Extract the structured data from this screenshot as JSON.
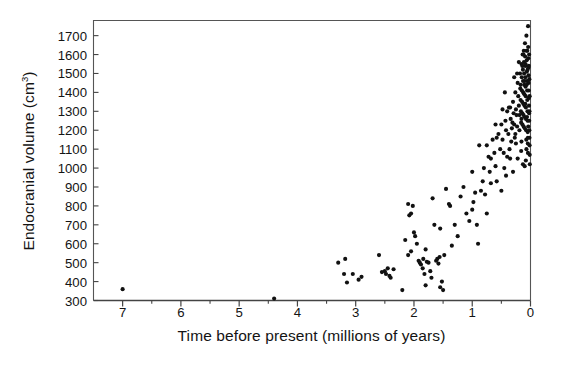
{
  "chart_data": {
    "type": "scatter",
    "title": "",
    "xlabel": "Time before present (millions of years)",
    "ylabel": "Endocranial volume (cm³)",
    "ylabel_text": "Endocranial volume (cm",
    "ylabel_sup": "3",
    "ylabel_tail": ")",
    "xlim": [
      7.5,
      0
    ],
    "ylim": [
      300,
      1780
    ],
    "x_reversed": true,
    "grid": false,
    "legend": null,
    "xticks": [
      7,
      6,
      5,
      4,
      3,
      2,
      1,
      0
    ],
    "xtick_labels": [
      "7",
      "6",
      "5",
      "4",
      "3",
      "2",
      "1",
      "0"
    ],
    "xminor_ticks": [
      6.5,
      5.5,
      4.5,
      3.5,
      2.5,
      1.5,
      0.5
    ],
    "yticks": [
      300,
      400,
      500,
      600,
      700,
      800,
      900,
      1000,
      1100,
      1200,
      1300,
      1400,
      1500,
      1600,
      1700
    ],
    "ytick_labels": [
      "300",
      "400",
      "500",
      "600",
      "700",
      "800",
      "900",
      "1000",
      "1100",
      "1200",
      "1300",
      "1400",
      "1500",
      "1600",
      "1700"
    ],
    "marker": "filled-circle",
    "marker_color": "#111111",
    "marker_size_px": 3.0,
    "points": [
      [
        7.0,
        360
      ],
      [
        4.4,
        310
      ],
      [
        3.3,
        500
      ],
      [
        3.2,
        440
      ],
      [
        3.18,
        520
      ],
      [
        3.15,
        395
      ],
      [
        3.05,
        440
      ],
      [
        2.95,
        410
      ],
      [
        2.9,
        425
      ],
      [
        2.6,
        540
      ],
      [
        2.55,
        450
      ],
      [
        2.5,
        455
      ],
      [
        2.48,
        440
      ],
      [
        2.45,
        470
      ],
      [
        2.42,
        430
      ],
      [
        2.4,
        420
      ],
      [
        2.35,
        465
      ],
      [
        2.2,
        355
      ],
      [
        2.15,
        620
      ],
      [
        2.1,
        810
      ],
      [
        2.08,
        750
      ],
      [
        2.05,
        760
      ],
      [
        2.02,
        800
      ],
      [
        2.0,
        660
      ],
      [
        1.98,
        640
      ],
      [
        1.95,
        600
      ],
      [
        1.92,
        510
      ],
      [
        1.9,
        500
      ],
      [
        1.88,
        490
      ],
      [
        1.85,
        470
      ],
      [
        1.84,
        520
      ],
      [
        1.82,
        440
      ],
      [
        1.8,
        380
      ],
      [
        1.78,
        505
      ],
      [
        1.75,
        500
      ],
      [
        1.72,
        455
      ],
      [
        1.7,
        420
      ],
      [
        1.68,
        840
      ],
      [
        1.65,
        700
      ],
      [
        1.62,
        510
      ],
      [
        1.6,
        520
      ],
      [
        1.58,
        495
      ],
      [
        1.56,
        530
      ],
      [
        1.55,
        370
      ],
      [
        1.52,
        400
      ],
      [
        1.5,
        355
      ],
      [
        1.45,
        890
      ],
      [
        1.4,
        810
      ],
      [
        1.38,
        800
      ],
      [
        1.2,
        850
      ],
      [
        1.15,
        900
      ],
      [
        1.1,
        760
      ],
      [
        1.05,
        720
      ],
      [
        1.0,
        980
      ],
      [
        0.98,
        820
      ],
      [
        0.95,
        870
      ],
      [
        0.92,
        700
      ],
      [
        0.9,
        600
      ],
      [
        0.85,
        880
      ],
      [
        0.82,
        930
      ],
      [
        0.8,
        1000
      ],
      [
        0.78,
        860
      ],
      [
        0.75,
        760
      ],
      [
        0.72,
        1060
      ],
      [
        0.7,
        980
      ],
      [
        0.68,
        920
      ],
      [
        0.65,
        1150
      ],
      [
        0.62,
        1080
      ],
      [
        0.6,
        1010
      ],
      [
        0.58,
        930
      ],
      [
        0.55,
        1180
      ],
      [
        0.52,
        1100
      ],
      [
        0.5,
        1230
      ],
      [
        0.48,
        1150
      ],
      [
        0.46,
        1080
      ],
      [
        0.45,
        1000
      ],
      [
        0.43,
        1250
      ],
      [
        0.42,
        1200
      ],
      [
        0.4,
        1300
      ],
      [
        0.38,
        1180
      ],
      [
        0.36,
        1100
      ],
      [
        0.35,
        1320
      ],
      [
        0.34,
        1260
      ],
      [
        0.32,
        1210
      ],
      [
        0.3,
        1350
      ],
      [
        0.29,
        1290
      ],
      [
        0.28,
        1230
      ],
      [
        0.27,
        1160
      ],
      [
        0.26,
        1400
      ],
      [
        0.25,
        1310
      ],
      [
        0.24,
        1280
      ],
      [
        0.23,
        1220
      ],
      [
        0.22,
        1450
      ],
      [
        0.21,
        1380
      ],
      [
        0.2,
        1330
      ],
      [
        0.19,
        1280
      ],
      [
        0.18,
        1500
      ],
      [
        0.175,
        1420
      ],
      [
        0.17,
        1360
      ],
      [
        0.165,
        1300
      ],
      [
        0.16,
        1240
      ],
      [
        0.155,
        1550
      ],
      [
        0.15,
        1480
      ],
      [
        0.148,
        1410
      ],
      [
        0.145,
        1350
      ],
      [
        0.14,
        1290
      ],
      [
        0.138,
        1230
      ],
      [
        0.135,
        1600
      ],
      [
        0.13,
        1520
      ],
      [
        0.128,
        1460
      ],
      [
        0.125,
        1400
      ],
      [
        0.122,
        1340
      ],
      [
        0.12,
        1280
      ],
      [
        0.118,
        1220
      ],
      [
        0.115,
        1620
      ],
      [
        0.112,
        1560
      ],
      [
        0.11,
        1500
      ],
      [
        0.108,
        1440
      ],
      [
        0.105,
        1390
      ],
      [
        0.102,
        1330
      ],
      [
        0.1,
        1270
      ],
      [
        0.098,
        1210
      ],
      [
        0.095,
        1660
      ],
      [
        0.092,
        1590
      ],
      [
        0.09,
        1540
      ],
      [
        0.088,
        1480
      ],
      [
        0.085,
        1430
      ],
      [
        0.082,
        1380
      ],
      [
        0.08,
        1320
      ],
      [
        0.078,
        1260
      ],
      [
        0.075,
        1200
      ],
      [
        0.072,
        1150
      ],
      [
        0.07,
        1700
      ],
      [
        0.068,
        1620
      ],
      [
        0.065,
        1570
      ],
      [
        0.062,
        1510
      ],
      [
        0.06,
        1460
      ],
      [
        0.058,
        1410
      ],
      [
        0.055,
        1360
      ],
      [
        0.052,
        1300
      ],
      [
        0.05,
        1250
      ],
      [
        0.048,
        1190
      ],
      [
        0.046,
        1130
      ],
      [
        0.044,
        1080
      ],
      [
        0.042,
        1750
      ],
      [
        0.04,
        1640
      ],
      [
        0.038,
        1580
      ],
      [
        0.036,
        1530
      ],
      [
        0.034,
        1490
      ],
      [
        0.032,
        1450
      ],
      [
        0.03,
        1410
      ],
      [
        0.028,
        1370
      ],
      [
        0.026,
        1330
      ],
      [
        0.024,
        1290
      ],
      [
        0.022,
        1250
      ],
      [
        0.02,
        1200
      ],
      [
        0.018,
        1160
      ],
      [
        0.016,
        1120
      ],
      [
        0.014,
        1070
      ],
      [
        0.012,
        1020
      ],
      [
        0.35,
        1050
      ],
      [
        0.6,
        1230
      ],
      [
        0.75,
        1120
      ],
      [
        0.3,
        980
      ],
      [
        0.5,
        880
      ],
      [
        0.44,
        1400
      ],
      [
        0.28,
        1480
      ],
      [
        0.2,
        1560
      ],
      [
        0.16,
        1090
      ],
      [
        0.25,
        1130
      ],
      [
        0.33,
        1140
      ],
      [
        0.4,
        1060
      ],
      [
        0.12,
        1600
      ],
      [
        0.09,
        1340
      ],
      [
        0.06,
        1270
      ],
      [
        0.055,
        1620
      ],
      [
        0.13,
        1020
      ],
      [
        0.1,
        1010
      ],
      [
        0.08,
        1040
      ],
      [
        0.07,
        1100
      ],
      [
        0.045,
        1160
      ],
      [
        0.038,
        1220
      ],
      [
        0.03,
        1540
      ],
      [
        0.02,
        1470
      ],
      [
        0.015,
        1380
      ],
      [
        0.018,
        1300
      ],
      [
        0.024,
        1600
      ],
      [
        0.05,
        1520
      ],
      [
        0.065,
        1440
      ],
      [
        0.085,
        1550
      ],
      [
        0.1,
        1460
      ],
      [
        0.115,
        1340
      ],
      [
        0.14,
        1540
      ],
      [
        0.155,
        1260
      ],
      [
        0.17,
        1440
      ],
      [
        0.19,
        1200
      ],
      [
        0.23,
        1500
      ],
      [
        0.26,
        1180
      ],
      [
        0.31,
        1240
      ],
      [
        0.37,
        1320
      ],
      [
        0.22,
        1050
      ],
      [
        0.155,
        1140
      ],
      [
        0.42,
        960
      ],
      [
        0.48,
        1310
      ],
      [
        0.58,
        1160
      ],
      [
        0.68,
        1050
      ],
      [
        0.88,
        1120
      ],
      [
        1.0,
        780
      ],
      [
        1.3,
        700
      ],
      [
        1.55,
        680
      ],
      [
        1.8,
        570
      ],
      [
        2.05,
        560
      ],
      [
        2.1,
        540
      ],
      [
        1.48,
        540
      ],
      [
        1.35,
        590
      ],
      [
        1.25,
        640
      ]
    ]
  },
  "axes": {
    "frame_color": "#555555",
    "axis_color": "#444444",
    "background": "#ffffff"
  }
}
